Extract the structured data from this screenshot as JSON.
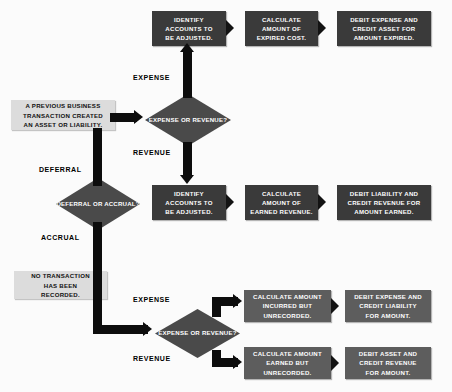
{
  "diagram": {
    "colors": {
      "box_dark": "#3a3a3a",
      "box_mid": "#5d5d5d",
      "box_light": "#dcdcdc",
      "diamond": "#4a4a4a",
      "connector": "#0d0d0d",
      "background": "#fbfbfb"
    },
    "start_nodes": [
      {
        "id": "start-previous-transaction",
        "lines": [
          "A PREVIOUS BUSINESS",
          "TRANSACTION CREATED",
          "AN ASSET OR LIABILITY."
        ]
      },
      {
        "id": "start-no-transaction",
        "lines": [
          "NO TRANSACTION",
          "HAS BEEN",
          "RECORDED."
        ]
      }
    ],
    "decisions": [
      {
        "id": "decision-expense-or-revenue-top",
        "lines": [
          "EXPENSE",
          "OR",
          "REVENUE?"
        ]
      },
      {
        "id": "decision-deferral-or-accrual",
        "lines": [
          "DEFERRAL",
          "OR",
          "ACCRUAL?"
        ]
      },
      {
        "id": "decision-expense-or-revenue-bottom",
        "lines": [
          "EXPENSE",
          "OR",
          "REVENUE?"
        ]
      }
    ],
    "branch_labels": {
      "expense_top": "EXPENSE",
      "revenue_top": "REVENUE",
      "deferral": "DEFERRAL",
      "accrual": "ACCRUAL",
      "expense_bottom": "EXPENSE",
      "revenue_bottom": "REVENUE"
    },
    "rows": [
      {
        "id": "row-deferral-expense",
        "steps": [
          {
            "id": "identify-accounts-expense",
            "lines": [
              "IDENTIFY",
              "ACCOUNTS TO",
              "BE ADJUSTED."
            ]
          },
          {
            "id": "calculate-expired-cost",
            "lines": [
              "CALCULATE",
              "AMOUNT OF",
              "EXPIRED COST."
            ]
          },
          {
            "id": "debit-expense-credit-asset",
            "lines": [
              "DEBIT EXPENSE AND",
              "CREDIT ASSET FOR",
              "AMOUNT EXPIRED."
            ]
          }
        ]
      },
      {
        "id": "row-deferral-revenue",
        "steps": [
          {
            "id": "identify-accounts-revenue",
            "lines": [
              "IDENTIFY",
              "ACCOUNTS TO",
              "BE ADJUSTED."
            ]
          },
          {
            "id": "calculate-earned-revenue",
            "lines": [
              "CALCULATE",
              "AMOUNT OF",
              "EARNED REVENUE."
            ]
          },
          {
            "id": "debit-liability-credit-revenue",
            "lines": [
              "DEBIT LIABILITY AND",
              "CREDIT REVENUE FOR",
              "AMOUNT EARNED."
            ]
          }
        ]
      },
      {
        "id": "row-accrual-expense",
        "steps": [
          {
            "id": "calculate-incurred-unrecorded",
            "lines": [
              "CALCULATE AMOUNT",
              "INCURRED BUT",
              "UNRECORDED."
            ]
          },
          {
            "id": "debit-expense-credit-liability",
            "lines": [
              "DEBIT EXPENSE AND",
              "CREDIT LIABILITY",
              "FOR AMOUNT."
            ]
          }
        ]
      },
      {
        "id": "row-accrual-revenue",
        "steps": [
          {
            "id": "calculate-earned-unrecorded",
            "lines": [
              "CALCULATE AMOUNT",
              "EARNED BUT",
              "UNRECORDED."
            ]
          },
          {
            "id": "debit-asset-credit-revenue",
            "lines": [
              "DEBIT ASSET AND",
              "CREDIT REVENUE",
              "FOR AMOUNT."
            ]
          }
        ]
      }
    ]
  }
}
